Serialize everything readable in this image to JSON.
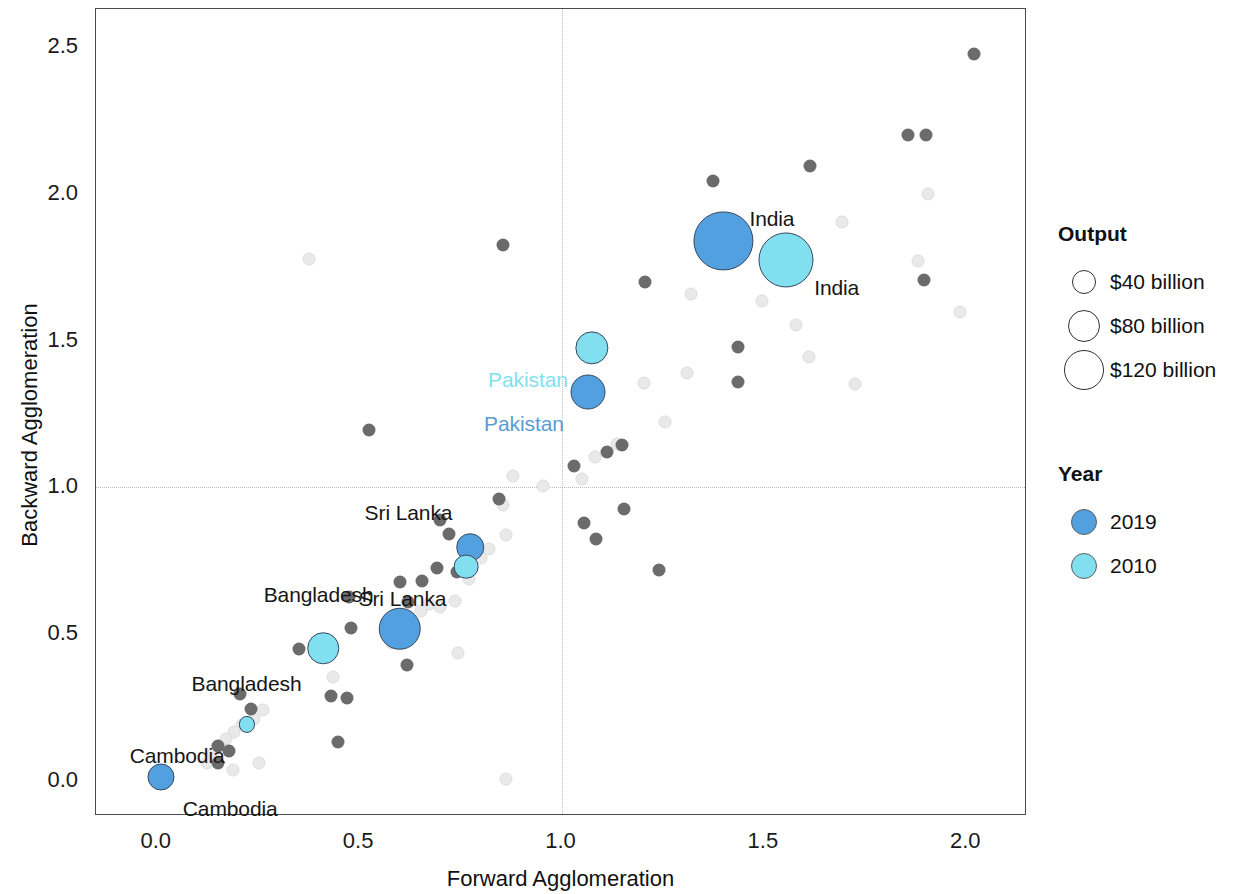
{
  "chart_data": {
    "type": "scatter",
    "title": "",
    "xlabel": "Forward Agglomeration",
    "ylabel": "Backward Agglomeration",
    "xlim": [
      -0.15,
      2.15
    ],
    "ylim": [
      -0.12,
      2.63
    ],
    "xticks": [
      "0.0",
      "0.5",
      "1.0",
      "1.5",
      "2.0"
    ],
    "xtick_values": [
      0.0,
      0.5,
      1.0,
      1.5,
      2.0
    ],
    "yticks": [
      "0.0",
      "0.5",
      "1.0",
      "1.5",
      "2.0",
      "2.5"
    ],
    "ytick_values": [
      0.0,
      0.5,
      1.0,
      1.5,
      2.0,
      2.5
    ],
    "grid": "reference lines at x=1.0 and y=1.0",
    "reference_lines": {
      "x": 1.0,
      "y": 1.0
    },
    "legend_position": "right",
    "size_encoding": "Output",
    "color_encoding": "Year",
    "highlighted": [
      {
        "country": "India",
        "year": "2019",
        "x": 1.4,
        "y": 1.84,
        "size": 120,
        "label_dx": 26,
        "label_dy": -22,
        "align": "left"
      },
      {
        "country": "India",
        "year": "2010",
        "x": 1.555,
        "y": 1.775,
        "size": 104,
        "label_dx": 28,
        "label_dy": 28,
        "align": "left"
      },
      {
        "country": "Pakistan",
        "year": "2019",
        "x": 1.065,
        "y": 1.325,
        "size": 42,
        "label_dx": -24,
        "label_dy": 32,
        "align": "right"
      },
      {
        "country": "Pakistan",
        "year": "2010",
        "x": 1.075,
        "y": 1.475,
        "size": 38,
        "label_dx": -24,
        "label_dy": 32,
        "align": "right"
      },
      {
        "country": "Sri Lanka",
        "year": "2019",
        "x": 0.775,
        "y": 0.795,
        "size": 26,
        "label_dx": -18,
        "label_dy": -34,
        "align": "right"
      },
      {
        "country": "Sri Lanka",
        "year": "2010",
        "x": 0.765,
        "y": 0.73,
        "size": 21,
        "label_dx": -20,
        "label_dy": 32,
        "align": "right"
      },
      {
        "country": "Bangladesh",
        "year": "2019",
        "x": 0.6,
        "y": 0.518,
        "size": 62,
        "label_dx": -26,
        "label_dy": -34,
        "align": "right"
      },
      {
        "country": "Bangladesh",
        "year": "2010",
        "x": 0.412,
        "y": 0.452,
        "size": 34,
        "label_dx": -22,
        "label_dy": 36,
        "align": "right"
      },
      {
        "country": "Cambodia",
        "year": "2019",
        "x": 0.01,
        "y": 0.012,
        "size": 25,
        "label_dx": 22,
        "label_dy": 32,
        "align": "left"
      },
      {
        "country": "Cambodia",
        "year": "2010",
        "x": 0.222,
        "y": 0.192,
        "size": 9,
        "label_dx": -22,
        "label_dy": 32,
        "align": "right"
      }
    ],
    "background_2019": [
      {
        "x": 2.02,
        "y": 2.478
      },
      {
        "x": 1.855,
        "y": 2.2
      },
      {
        "x": 1.9,
        "y": 2.2
      },
      {
        "x": 1.615,
        "y": 2.095
      },
      {
        "x": 1.375,
        "y": 2.045
      },
      {
        "x": 1.895,
        "y": 1.705
      },
      {
        "x": 1.207,
        "y": 1.7
      },
      {
        "x": 1.435,
        "y": 1.478
      },
      {
        "x": 1.435,
        "y": 1.36
      },
      {
        "x": 1.39,
        "y": 1.905
      },
      {
        "x": 0.855,
        "y": 1.825
      },
      {
        "x": 0.525,
        "y": 1.197
      },
      {
        "x": 1.15,
        "y": 1.145
      },
      {
        "x": 1.03,
        "y": 1.072
      },
      {
        "x": 1.112,
        "y": 1.12
      },
      {
        "x": 1.155,
        "y": 0.925
      },
      {
        "x": 1.055,
        "y": 0.88
      },
      {
        "x": 1.085,
        "y": 0.825
      },
      {
        "x": 0.845,
        "y": 0.96
      },
      {
        "x": 0.7,
        "y": 0.89
      },
      {
        "x": 0.722,
        "y": 0.84
      },
      {
        "x": 0.742,
        "y": 0.712
      },
      {
        "x": 0.692,
        "y": 0.725
      },
      {
        "x": 0.655,
        "y": 0.68
      },
      {
        "x": 0.6,
        "y": 0.678
      },
      {
        "x": 0.62,
        "y": 0.61
      },
      {
        "x": 0.475,
        "y": 0.625
      },
      {
        "x": 0.48,
        "y": 0.522
      },
      {
        "x": 0.352,
        "y": 0.448
      },
      {
        "x": 0.618,
        "y": 0.396
      },
      {
        "x": 0.43,
        "y": 0.288
      },
      {
        "x": 0.47,
        "y": 0.282
      },
      {
        "x": 0.205,
        "y": 0.297
      },
      {
        "x": 0.232,
        "y": 0.244
      },
      {
        "x": 0.448,
        "y": 0.133
      },
      {
        "x": 0.152,
        "y": 0.12
      },
      {
        "x": 0.178,
        "y": 0.1
      },
      {
        "x": 0.152,
        "y": 0.062
      },
      {
        "x": 0.762,
        "y": 0.718
      },
      {
        "x": 1.24,
        "y": 0.718
      }
    ],
    "background_2010": [
      {
        "x": 1.88,
        "y": 1.77
      },
      {
        "x": 1.905,
        "y": 2.0
      },
      {
        "x": 1.985,
        "y": 1.598
      },
      {
        "x": 1.693,
        "y": 1.905
      },
      {
        "x": 1.495,
        "y": 1.635
      },
      {
        "x": 1.58,
        "y": 1.553
      },
      {
        "x": 1.612,
        "y": 1.443
      },
      {
        "x": 1.31,
        "y": 1.39
      },
      {
        "x": 1.205,
        "y": 1.355
      },
      {
        "x": 1.255,
        "y": 1.222
      },
      {
        "x": 1.138,
        "y": 1.148
      },
      {
        "x": 1.082,
        "y": 1.105
      },
      {
        "x": 1.05,
        "y": 1.028
      },
      {
        "x": 0.955,
        "y": 1.005
      },
      {
        "x": 0.88,
        "y": 1.04
      },
      {
        "x": 0.855,
        "y": 0.94
      },
      {
        "x": 0.862,
        "y": 0.838
      },
      {
        "x": 0.822,
        "y": 0.79
      },
      {
        "x": 0.8,
        "y": 0.758
      },
      {
        "x": 0.772,
        "y": 0.686
      },
      {
        "x": 0.738,
        "y": 0.612
      },
      {
        "x": 0.7,
        "y": 0.592
      },
      {
        "x": 0.672,
        "y": 0.602
      },
      {
        "x": 0.652,
        "y": 0.578
      },
      {
        "x": 0.622,
        "y": 0.562
      },
      {
        "x": 0.598,
        "y": 0.546
      },
      {
        "x": 0.435,
        "y": 0.352
      },
      {
        "x": 0.375,
        "y": 1.778
      },
      {
        "x": 1.32,
        "y": 1.66
      },
      {
        "x": 1.725,
        "y": 1.352
      },
      {
        "x": 0.262,
        "y": 0.242
      },
      {
        "x": 0.24,
        "y": 0.212
      },
      {
        "x": 0.21,
        "y": 0.19
      },
      {
        "x": 0.192,
        "y": 0.165
      },
      {
        "x": 0.172,
        "y": 0.142
      },
      {
        "x": 0.152,
        "y": 0.118
      },
      {
        "x": 0.138,
        "y": 0.092
      },
      {
        "x": 0.125,
        "y": 0.06
      },
      {
        "x": 0.188,
        "y": 0.038
      },
      {
        "x": 0.582,
        "y": 0.47
      },
      {
        "x": 0.862,
        "y": 0.005
      },
      {
        "x": 0.745,
        "y": 0.435
      },
      {
        "x": 0.252,
        "y": 0.062
      }
    ]
  },
  "axis": {
    "x_title": "Forward Agglomeration",
    "y_title": "Backward Agglomeration"
  },
  "legend": {
    "output": {
      "title": "Output",
      "items": [
        {
          "label": "$40 billion",
          "diameter": 24
        },
        {
          "label": "$80 billion",
          "diameter": 32
        },
        {
          "label": "$120 billion",
          "diameter": 40
        }
      ]
    },
    "year": {
      "title": "Year",
      "items": [
        {
          "label": "2019",
          "color": "#53a0e0"
        },
        {
          "label": "2010",
          "color": "#82dff0"
        }
      ]
    }
  }
}
